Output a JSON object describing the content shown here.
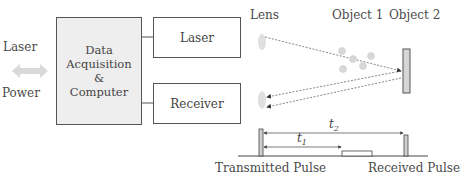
{
  "left": {
    "laser_label": "Laser",
    "power_label": "Power",
    "arrow_icon": "double-arrow-icon"
  },
  "daq_box": {
    "line1": "Data",
    "line2": "Acquisition",
    "line3": "&",
    "line4": "Computer"
  },
  "laser_box": {
    "label": "Laser"
  },
  "receiver_box": {
    "label": "Receiver"
  },
  "optics": {
    "lens_label": "Lens",
    "object1_label": "Object 1",
    "object2_label": "Object 2"
  },
  "pulse": {
    "t1_label": "t",
    "t1_sub": "1",
    "t2_label": "t",
    "t2_sub": "2",
    "transmitted_label": "Transmitted Pulse",
    "received_label": "Received Pulse"
  },
  "colors": {
    "box_fill": "#eeeeee",
    "stroke": "#555555",
    "lens": "#dddddd",
    "arrow": "#d9d9d9"
  }
}
